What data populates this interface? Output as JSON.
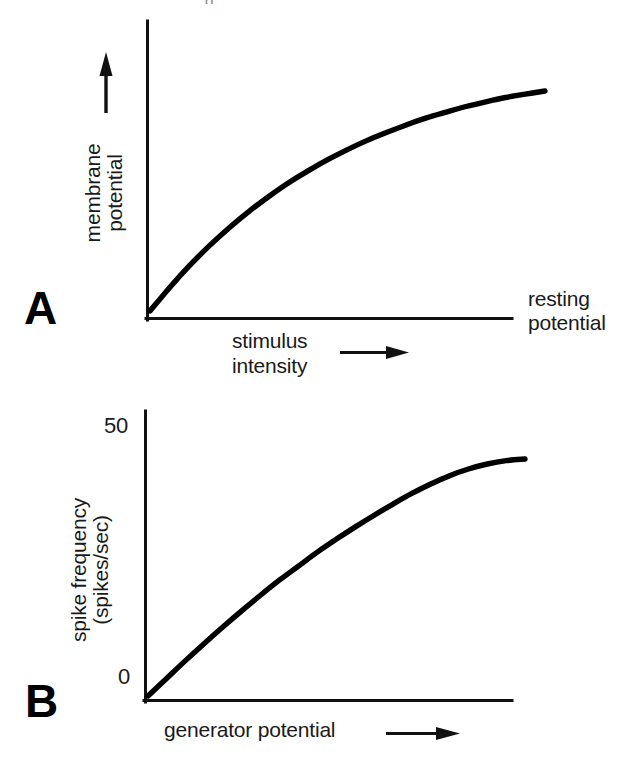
{
  "figure": {
    "background": "#ffffff",
    "ink": "#000000",
    "width": 639,
    "height": 770,
    "cropped_title_fragment": "o"
  },
  "panels": [
    {
      "id": "A",
      "letter": "A",
      "y_axis_label_line1": "membrane",
      "y_axis_label_line2": "potential",
      "y_axis_arrow": "up-arrow",
      "x_axis_label_line1": "stimulus",
      "x_axis_label_line2": "intensity",
      "x_axis_arrow": "right-arrow",
      "baseline_label_line1": "resting",
      "baseline_label_line2": "potential"
    },
    {
      "id": "B",
      "letter": "B",
      "y_axis_label_line1": "spike frequency",
      "y_axis_label_line2": "(spikes/sec)",
      "y_tick_top": "50",
      "y_tick_bottom": "0",
      "x_axis_label": "generator potential",
      "x_axis_arrow": "right-arrow"
    }
  ],
  "chart_data": [
    {
      "type": "line",
      "panel": "A",
      "title": "",
      "xlabel": "stimulus intensity",
      "ylabel": "membrane potential",
      "annotations": [
        "resting potential"
      ],
      "grid": false,
      "legend": "none",
      "axis_ticks": [],
      "xlim": [
        0,
        100
      ],
      "ylim": [
        0,
        100
      ],
      "description": "Saturating exponential: receptor potential amplitude grows with stimulus intensity and plateaus.",
      "x": [
        0,
        5,
        10,
        15,
        20,
        25,
        30,
        35,
        40,
        45,
        50,
        55,
        60,
        65,
        70,
        75,
        80,
        85,
        90,
        95,
        100
      ],
      "y": [
        0,
        10.5,
        20.2,
        29.0,
        37.0,
        44.3,
        50.9,
        57.0,
        62.4,
        67.4,
        71.9,
        76.0,
        79.6,
        83.0,
        86.0,
        88.6,
        91.1,
        93.2,
        95.1,
        96.6,
        98.0
      ]
    },
    {
      "type": "line",
      "panel": "B",
      "title": "",
      "xlabel": "generator potential",
      "ylabel": "spike frequency (spikes/sec)",
      "annotations": [],
      "grid": false,
      "legend": "none",
      "axis_ticks": [
        "0",
        "50"
      ],
      "xlim": [
        0,
        100
      ],
      "ylim": [
        0,
        50
      ],
      "description": "Spike frequency rises nearly linearly with generator potential, then saturates just below 50 spikes/sec.",
      "x": [
        0,
        5,
        10,
        15,
        20,
        25,
        30,
        35,
        40,
        45,
        50,
        55,
        60,
        65,
        70,
        75,
        80,
        85,
        90,
        95,
        100
      ],
      "y": [
        0,
        3.2,
        6.4,
        9.5,
        12.5,
        15.4,
        18.2,
        20.9,
        23.4,
        25.9,
        28.2,
        30.4,
        32.5,
        34.5,
        36.4,
        38.1,
        39.6,
        40.8,
        41.7,
        42.3,
        42.6
      ]
    }
  ]
}
